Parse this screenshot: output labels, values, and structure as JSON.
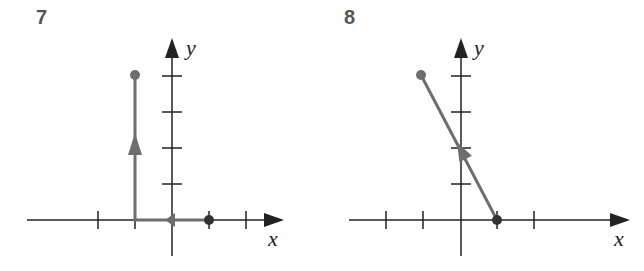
{
  "panels": [
    {
      "label": "7",
      "x_axis_label": "x",
      "y_axis_label": "y",
      "path_points": [
        [
          1,
          0
        ],
        [
          -1,
          0
        ],
        [
          -1,
          4
        ]
      ],
      "start_point": [
        1,
        0
      ],
      "end_point": [
        -1,
        4
      ],
      "arrows": [
        "left along x-axis",
        "up along x=-1"
      ]
    },
    {
      "label": "8",
      "x_axis_label": "x",
      "y_axis_label": "y",
      "path_points": [
        [
          1,
          0
        ],
        [
          -1,
          4
        ]
      ],
      "start_point": [
        1,
        0
      ],
      "end_point": [
        -1,
        4
      ],
      "arrows": [
        "up-left along segment"
      ]
    }
  ],
  "colors": {
    "axis": "#222222",
    "path": "#6e6e6e",
    "label": "#555555"
  }
}
